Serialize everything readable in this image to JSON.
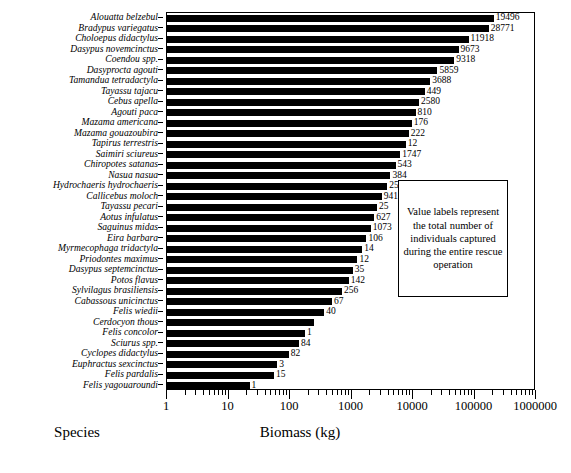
{
  "chart_data": {
    "type": "bar",
    "orientation": "horizontal",
    "title": "",
    "xlabel": "Biomass (kg)",
    "ylabel": "Species",
    "xscale": "log",
    "xlim": [
      1,
      1000000
    ],
    "xticks": [
      "1",
      "10",
      "100",
      "1000",
      "10000",
      "100000",
      "1000000"
    ],
    "grid": false,
    "legend": false,
    "annotation": "Value labels represent the total number of individuals captured during the entire rescue operation",
    "value_label_note": "Numbers at bar ends are counts of individuals captured, not biomass",
    "categories": [
      "Alouatta belzebul",
      "Bradypus variegatus",
      "Choloepus didactylus",
      "Dasypus novemcinctus",
      "Coendou spp.",
      "Dasyprocta agouti",
      "Tamandua tetradactyla",
      "Tayassu tajacu",
      "Cebus apella",
      "Agouti paca",
      "Mazama americana",
      "Mazama gouazoubira",
      "Tapirus terrestris",
      "Saimiri sciureus",
      "Chiropotes satanas",
      "Nasua nasua",
      "Hydrochaeris hydrochaeris",
      "Callicebus moloch",
      "Tayassu pecari",
      "Aotus infulatus",
      "Saguinus midas",
      "Eira barbara",
      "Myrmecophaga tridactyla",
      "Priodontes maximus",
      "Dasypus septemcinctus",
      "Potos flavus",
      "Sylvilagus brasiliensis",
      "Cabassous unicinctus",
      "Felis wiedii",
      "Cerdocyon thous",
      "Felis concolor",
      "Sciurus spp.",
      "Cyclopes didactylus",
      "Euphractus sexcinctus",
      "Felis pardalis",
      "Felis yagouaroundi"
    ],
    "values": [
      205000,
      171000,
      80000,
      55000,
      47000,
      25000,
      19000,
      15500,
      12500,
      11000,
      9500,
      8500,
      7600,
      6200,
      5200,
      4300,
      3800,
      3100,
      2600,
      2350,
      2050,
      1750,
      1500,
      1250,
      1050,
      900,
      700,
      480,
      360,
      250,
      175,
      140,
      95,
      62,
      55,
      22
    ],
    "value_labels": [
      "19496",
      "28771",
      "11918",
      "9673",
      "9318",
      "5859",
      "3688",
      "449",
      "2580",
      "810",
      "176",
      "222",
      "12",
      "1747",
      "543",
      "384",
      "25",
      "941",
      "25",
      "627",
      "1073",
      "106",
      "14",
      "12",
      "35",
      "142",
      "256",
      "67",
      "40",
      "",
      "1",
      "84",
      "82",
      "3",
      "15",
      "1"
    ]
  }
}
